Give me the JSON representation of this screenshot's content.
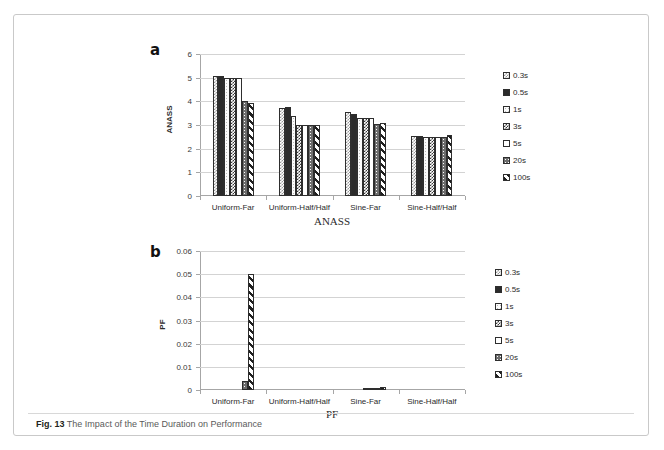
{
  "figure": {
    "caption_label": "Fig. 13",
    "caption_text": "The Impact of the Time Duration on Performance"
  },
  "panels": {
    "a_letter": "a",
    "b_letter": "b"
  },
  "legend": {
    "entries": [
      {
        "label": "0.3s",
        "pattern": "light-checker"
      },
      {
        "label": "0.5s",
        "pattern": "solid-dark"
      },
      {
        "label": "1s",
        "pattern": "fine-dots-white"
      },
      {
        "label": "3s",
        "pattern": "dense-checker"
      },
      {
        "label": "5s",
        "pattern": "sparse-dots"
      },
      {
        "label": "20s",
        "pattern": "grey-speckle"
      },
      {
        "label": "100s",
        "pattern": "diagonal-stripes"
      }
    ]
  },
  "chart_data": [
    {
      "type": "bar",
      "panel": "a",
      "title": "",
      "xlabel": "ANASS",
      "ylabel": "ANASS",
      "ylim": [
        0,
        6
      ],
      "yticks": [
        0,
        1,
        2,
        3,
        4,
        5,
        6
      ],
      "ytick_labels": [
        "0",
        "1",
        "2",
        "3",
        "4",
        "5",
        "6"
      ],
      "grid": true,
      "legend_position": "right",
      "categories": [
        "Uniform-Far",
        "Uniform-Half/Half",
        "Sine-Far",
        "Sine-Half/Half"
      ],
      "series": [
        {
          "name": "0.3s",
          "values": [
            5.05,
            3.7,
            3.55,
            2.55
          ]
        },
        {
          "name": "0.5s",
          "values": [
            5.05,
            3.75,
            3.45,
            2.52
          ]
        },
        {
          "name": "1s",
          "values": [
            5.0,
            3.4,
            3.3,
            2.5
          ]
        },
        {
          "name": "3s",
          "values": [
            5.0,
            3.0,
            3.3,
            2.5
          ]
        },
        {
          "name": "5s",
          "values": [
            5.0,
            3.0,
            3.28,
            2.5
          ]
        },
        {
          "name": "20s",
          "values": [
            4.0,
            3.0,
            3.05,
            2.5
          ]
        },
        {
          "name": "100s",
          "values": [
            3.95,
            3.0,
            3.1,
            2.58
          ]
        }
      ]
    },
    {
      "type": "bar",
      "panel": "b",
      "title": "",
      "xlabel": "PF",
      "ylabel": "PF",
      "ylim": [
        0,
        0.06
      ],
      "yticks": [
        0,
        0.01,
        0.02,
        0.03,
        0.04,
        0.05,
        0.06
      ],
      "ytick_labels": [
        "0",
        "0.01",
        "0.02",
        "0.03",
        "0.04",
        "0.05",
        "0.06"
      ],
      "grid": true,
      "legend_position": "right",
      "categories": [
        "Uniform-Far",
        "Uniform-Half/Half",
        "Sine-Far",
        "Sine-Half/Half"
      ],
      "series": [
        {
          "name": "0.3s",
          "values": [
            0,
            0,
            0,
            0
          ]
        },
        {
          "name": "0.5s",
          "values": [
            0,
            0,
            0,
            0
          ]
        },
        {
          "name": "1s",
          "values": [
            0,
            0,
            0,
            0
          ]
        },
        {
          "name": "3s",
          "values": [
            0,
            0,
            0.0002,
            0
          ]
        },
        {
          "name": "5s",
          "values": [
            0,
            0,
            0.0004,
            0
          ]
        },
        {
          "name": "20s",
          "values": [
            0.0038,
            0,
            0.0006,
            0
          ]
        },
        {
          "name": "100s",
          "values": [
            0.05,
            0,
            0.0012,
            0
          ]
        }
      ]
    }
  ]
}
